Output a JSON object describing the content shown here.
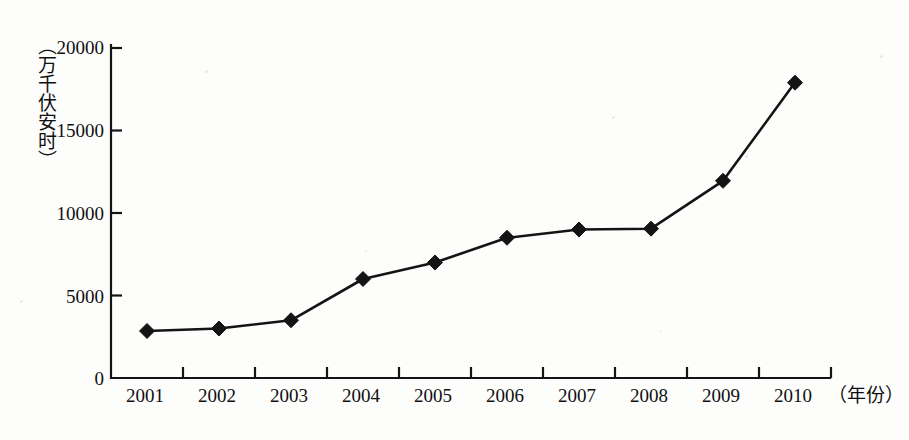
{
  "chart_data": {
    "type": "line",
    "title": "",
    "subtitle": "",
    "xlabel": "（年份）",
    "ylabel": "（万千伏安时）",
    "categories": [
      "2001",
      "2002",
      "2003",
      "2004",
      "2005",
      "2006",
      "2007",
      "2008",
      "2009",
      "2010"
    ],
    "values": [
      2850,
      3000,
      3500,
      6000,
      7000,
      8500,
      9000,
      9050,
      11950,
      17900
    ],
    "series": [
      {
        "name": "",
        "values": [
          2850,
          3000,
          3500,
          6000,
          7000,
          8500,
          9000,
          9050,
          11950,
          17900
        ]
      }
    ],
    "ylim": [
      0,
      20000
    ],
    "yticks": [
      "0",
      "5000",
      "10000",
      "15000",
      "20000"
    ],
    "ytick_values": [
      0,
      5000,
      10000,
      15000,
      20000
    ],
    "grid": false,
    "legend": false,
    "legend_position": "none",
    "marker": "diamond",
    "line_color": "#141414",
    "marker_color": "#141414",
    "axis_color": "#141414",
    "background_color": "#fdfdfc"
  }
}
